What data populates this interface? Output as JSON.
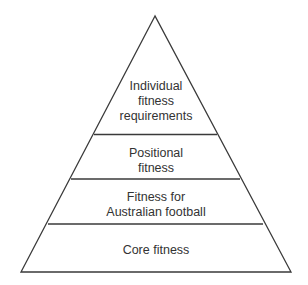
{
  "diagram": {
    "type": "pyramid",
    "levels_top_to_bottom": [
      {
        "name": "individual-fitness-requirements",
        "lines": [
          "Individual",
          "fitness",
          "requirements"
        ]
      },
      {
        "name": "positional-fitness",
        "lines": [
          "Positional",
          "fitness"
        ]
      },
      {
        "name": "fitness-for-australian-football",
        "lines": [
          "Fitness for",
          "Australian football"
        ]
      },
      {
        "name": "core-fitness",
        "lines": [
          "Core fitness"
        ]
      }
    ],
    "line_color": "#3a3a3a",
    "text_color": "#333333"
  }
}
